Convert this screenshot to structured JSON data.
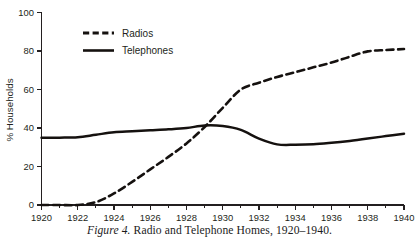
{
  "figure": {
    "caption_label": "Figure 4.",
    "caption_text": " Radio and Telephone Homes, 1920–1940."
  },
  "chart_data": {
    "type": "line",
    "title": "",
    "xlabel": "",
    "ylabel": "% Households",
    "xlim": [
      1920,
      1940
    ],
    "ylim": [
      0,
      100
    ],
    "grid": false,
    "legend_position": "top-left-inside",
    "x_ticks": [
      1920,
      1922,
      1924,
      1926,
      1928,
      1930,
      1932,
      1934,
      1936,
      1938,
      1940
    ],
    "x_tick_labels": [
      "1920",
      "1922",
      "1924",
      "1926",
      "1928",
      "1930",
      "1932",
      "1934",
      "1936",
      "1938",
      "1940"
    ],
    "x_minor_ticks": [
      1921,
      1923,
      1925,
      1927,
      1929,
      1931,
      1933,
      1935,
      1937,
      1939
    ],
    "y_ticks": [
      0,
      20,
      40,
      60,
      80,
      100
    ],
    "y_tick_labels": [
      "0",
      "20",
      "40",
      "60",
      "80",
      "100"
    ],
    "x": [
      1920,
      1921,
      1922,
      1923,
      1924,
      1925,
      1926,
      1927,
      1928,
      1929,
      1930,
      1931,
      1932,
      1933,
      1934,
      1935,
      1936,
      1937,
      1938,
      1939,
      1940
    ],
    "series": [
      {
        "name": "Radios",
        "style": "dashed",
        "color": "#15110f",
        "values": [
          0,
          0,
          0,
          1.5,
          6,
          12,
          18.5,
          25,
          32,
          40.5,
          50.5,
          60,
          63.5,
          66.5,
          69,
          71.5,
          74,
          77,
          79.8,
          80.5,
          81
        ]
      },
      {
        "name": "Telephones",
        "style": "solid",
        "color": "#15110f",
        "values": [
          35,
          35,
          35.2,
          36.5,
          37.8,
          38.3,
          38.8,
          39.3,
          40,
          41.3,
          41,
          39,
          34.5,
          31.5,
          31.3,
          31.5,
          32.3,
          33.3,
          34.5,
          35.8,
          37
        ]
      }
    ],
    "legend": [
      {
        "label": "Radios",
        "style": "dashed"
      },
      {
        "label": "Telephones",
        "style": "solid"
      }
    ]
  }
}
